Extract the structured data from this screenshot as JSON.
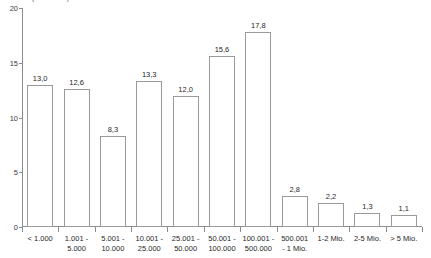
{
  "chart_data": {
    "type": "bar",
    "title": "in 1.000 (in Prozent)",
    "xlabel": "",
    "ylabel": "",
    "ylim": [
      0,
      20
    ],
    "yticks": [
      "0",
      "5",
      "10",
      "15",
      "20"
    ],
    "ytick_values": [
      0,
      5,
      10,
      15,
      20
    ],
    "grid": false,
    "legend": "none",
    "categories": [
      "< 1.000",
      "1.001 -\n5.000",
      "5.001 -\n10.000",
      "10.001 -\n25.000",
      "25.001 -\n50.000",
      "50.001 -\n100.000",
      "100.001 -\n500.000",
      "500.001\n- 1 Mio.",
      "1-2 Mio.",
      "2-5 Mio.",
      "> 5 Mio."
    ],
    "category_lines": [
      [
        "< 1.000"
      ],
      [
        "1.001 -",
        "5.000"
      ],
      [
        "5.001 -",
        "10.000"
      ],
      [
        "10.001 -",
        "25.000"
      ],
      [
        "25.001 -",
        "50.000"
      ],
      [
        "50.001 -",
        "100.000"
      ],
      [
        "100.001 -",
        "500.000"
      ],
      [
        "500.001",
        "- 1 Mio."
      ],
      [
        "1-2 Mio."
      ],
      [
        "2-5 Mio."
      ],
      [
        "> 5 Mio."
      ]
    ],
    "values": [
      13.0,
      12.6,
      8.3,
      13.3,
      12.0,
      15.6,
      17.8,
      2.8,
      2.2,
      1.3,
      1.1
    ],
    "value_labels": [
      "13,0",
      "12,6",
      "8,3",
      "13,3",
      "12,0",
      "15,6",
      "17,8",
      "2,8",
      "2,2",
      "1,3",
      "1,1"
    ],
    "bar_fill_color": "#ffffff",
    "bar_border_color": "#9a9a9a",
    "axis_color": "#8c8c8c",
    "text_color": "#1f1f1f"
  }
}
